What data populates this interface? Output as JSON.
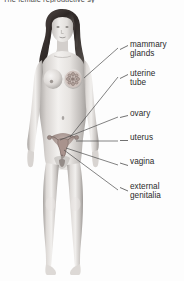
{
  "title": "The female reproductive sy",
  "colors": {
    "background": "#fdfdfd",
    "text": "#2b2b2b",
    "title_text": "#4a4a4a",
    "leader_line": "#4d4d4d",
    "skin_light": "#f2f0ee",
    "skin_mid": "#cfcbc7",
    "skin_shadow": "#9a9693",
    "hair": "#3a3330",
    "organ_tint": "#b9a9a4"
  },
  "figure": {
    "view": "anterior"
  },
  "labels": [
    {
      "id": "mammary-glands",
      "line1": "mammary",
      "line2": "glands",
      "text_x": 130,
      "text_y": 44,
      "stub_x": 120,
      "stub_y": 48,
      "target_x": 84,
      "target_y": 78
    },
    {
      "id": "uterine-tube",
      "line1": "uterine",
      "line2": "tube",
      "text_x": 130,
      "text_y": 73,
      "stub_x": 120,
      "stub_y": 77,
      "target_x": 70,
      "target_y": 137
    },
    {
      "id": "ovary",
      "line1": "ovary",
      "line2": "",
      "text_x": 130,
      "text_y": 113,
      "stub_x": 120,
      "stub_y": 117,
      "target_x": 60,
      "target_y": 140
    },
    {
      "id": "uterus",
      "line1": "uterus",
      "line2": "",
      "text_x": 130,
      "text_y": 137,
      "stub_x": 120,
      "stub_y": 141,
      "target_x": 76,
      "target_y": 141
    },
    {
      "id": "vagina",
      "line1": "vagina",
      "line2": "",
      "text_x": 130,
      "text_y": 161,
      "stub_x": 120,
      "stub_y": 165,
      "target_x": 66,
      "target_y": 148
    },
    {
      "id": "external-genitalia",
      "line1": "external",
      "line2": "genitalia",
      "text_x": 130,
      "text_y": 186,
      "stub_x": 120,
      "stub_y": 190,
      "target_x": 64,
      "target_y": 150
    }
  ]
}
